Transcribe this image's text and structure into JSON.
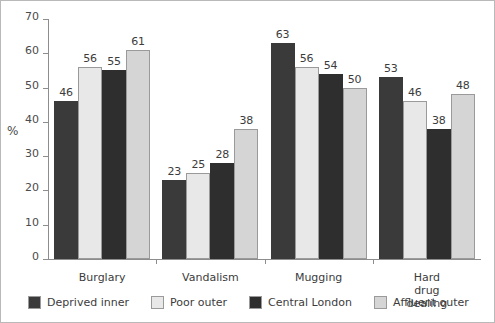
{
  "chart_data": {
    "type": "bar",
    "title": "",
    "xlabel": "",
    "ylabel": "%",
    "ylim": [
      0,
      70
    ],
    "yticks": [
      0,
      10,
      20,
      30,
      40,
      50,
      60,
      70
    ],
    "grid": false,
    "legend_position": "bottom",
    "categories": [
      "Burglary",
      "Vandalism",
      "Mugging",
      "Hard drug\ndealing"
    ],
    "series": [
      {
        "name": "Deprived inner",
        "color": "#3a3a3a",
        "values": [
          46,
          23,
          63,
          53
        ]
      },
      {
        "name": "Poor outer",
        "color": "#e8e8e8",
        "values": [
          56,
          25,
          56,
          46
        ]
      },
      {
        "name": "Central London",
        "color": "#2e2e2e",
        "values": [
          55,
          28,
          54,
          38
        ]
      },
      {
        "name": "Affluent outer",
        "color": "#d5d5d5",
        "values": [
          61,
          38,
          50,
          48
        ]
      }
    ]
  }
}
